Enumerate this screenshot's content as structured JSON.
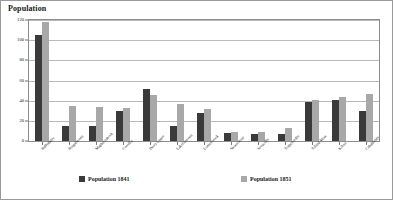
{
  "chart": {
    "title": "Population",
    "legend": [
      {
        "label": "Population 1841",
        "color": "#3a3a3a"
      },
      {
        "label": "Population 1851",
        "color": "#a8a8a8"
      }
    ]
  },
  "chart_data": {
    "type": "bar",
    "title": "Population",
    "xlabel": "",
    "ylabel": "Population",
    "ylim": [
      0,
      120
    ],
    "yticks": [
      0,
      20,
      40,
      60,
      80,
      100,
      120
    ],
    "grid": true,
    "legend_position": "bottom",
    "categories": [
      "Ballyduffy",
      "Bingalstown",
      "Maghernahock",
      "Coroflin",
      "Derry Upper",
      "Lakelinstown",
      "Lomeybrook",
      "Newermine",
      "Seeacolly",
      "Toaprystolly",
      "Toland Mow",
      "Kilrea",
      "Cahaldiddy"
    ],
    "series": [
      {
        "name": "Population 1841",
        "color": "#3a3a3a",
        "values": [
          105,
          15,
          15,
          30,
          52,
          15,
          28,
          8,
          7,
          7,
          39,
          41,
          30
        ]
      },
      {
        "name": "Population 1851",
        "color": "#a8a8a8",
        "values": [
          118,
          35,
          34,
          33,
          46,
          37,
          32,
          9,
          9,
          13,
          41,
          44,
          47
        ]
      }
    ]
  }
}
